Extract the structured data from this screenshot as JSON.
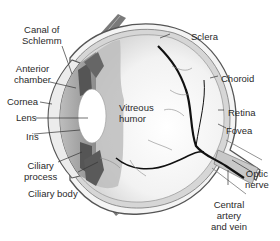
{
  "diagram": {
    "colors": {
      "outline": "#555555",
      "shade_dark": "#6a6a6a",
      "shade_mid": "#a8a8a8",
      "shade_light": "#d0d0d0",
      "vessel": "#111111",
      "nerve": "#c8c8c8"
    },
    "labels": {
      "canal_of_schlemm_1": "Canal of",
      "canal_of_schlemm_2": "Schlemm",
      "anterior_chamber_1": "Anterior",
      "anterior_chamber_2": "chamber",
      "cornea": "Cornea",
      "lens": "Lens",
      "iris": "Iris",
      "ciliary_process_1": "Ciliary",
      "ciliary_process_2": "process",
      "ciliary_body": "Ciliary body",
      "vitreous_humor_1": "Vitreous",
      "vitreous_humor_2": "humor",
      "sclera": "Sclera",
      "choroid": "Choroid",
      "retina": "Retina",
      "fovea": "Fovea",
      "optic_nerve_1": "Optic",
      "optic_nerve_2": "nerve",
      "central_artery_1": "Central",
      "central_artery_2": "artery",
      "central_artery_3": "and vein"
    }
  }
}
